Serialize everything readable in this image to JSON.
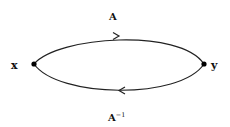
{
  "diagram": {
    "type": "loop-graph",
    "nodes": [
      {
        "id": "x",
        "label": "x",
        "position": "left"
      },
      {
        "id": "y",
        "label": "y",
        "position": "right"
      }
    ],
    "edges": [
      {
        "from": "x",
        "to": "y",
        "label": "A",
        "path": "upper arc",
        "direction": "right"
      },
      {
        "from": "y",
        "to": "x",
        "label_base": "A",
        "label_sup": "−1",
        "path": "lower arc",
        "direction": "left"
      }
    ],
    "colors": {
      "stroke": "#222222",
      "node": "#000000",
      "background": "#ffffff"
    }
  }
}
